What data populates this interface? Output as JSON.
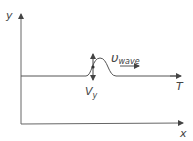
{
  "diagram": {
    "axes": {
      "y_label": "y",
      "x_label": "x"
    },
    "string": {
      "tension_label": "T"
    },
    "pulse": {
      "velocity_label_main": "υ",
      "velocity_label_sub": "wave",
      "transverse_velocity_main": "V",
      "transverse_velocity_sub": "y"
    },
    "colors": {
      "line": "#555555",
      "text": "#444444",
      "background": "#ffffff"
    }
  }
}
